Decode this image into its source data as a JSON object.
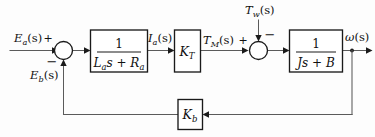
{
  "diagram": {
    "type": "control-system-block-diagram",
    "signals": {
      "input": "E",
      "input_sub": "a",
      "input_paren": "(s)",
      "feedback_voltage": "E",
      "feedback_voltage_sub": "b",
      "feedback_voltage_paren": "(s)",
      "armature_current": "I",
      "armature_current_sub": "a",
      "armature_current_paren": "(s)",
      "motor_torque": "T",
      "motor_torque_sub": "M",
      "motor_torque_paren": "(s)",
      "disturbance_torque": "T",
      "disturbance_torque_sub": "w",
      "disturbance_torque_paren": "(s)",
      "output": "ω",
      "output_paren": "(s)"
    },
    "blocks": [
      {
        "id": "electrical-block",
        "kind": "transfer-function",
        "numerator": "1",
        "denominator_main": "L",
        "denominator_sub": "a",
        "denominator_rest": "s + R",
        "denominator_sub2": "a",
        "label_plain": "1/(La s + Ra)"
      },
      {
        "id": "torque-constant-block",
        "kind": "gain",
        "symbol": "K",
        "subscript": "T",
        "label_plain": "KT"
      },
      {
        "id": "mechanical-block",
        "kind": "transfer-function",
        "numerator": "1",
        "denominator_main": "Js + B",
        "label_plain": "1/(Js + B)"
      },
      {
        "id": "back-emf-block",
        "kind": "gain",
        "symbol": "K",
        "subscript": "b",
        "label_plain": "Kb"
      }
    ],
    "summing_junctions": [
      {
        "id": "voltage-summer",
        "signs": {
          "left_input": "+",
          "bottom_input": "−"
        }
      },
      {
        "id": "torque-summer",
        "signs": {
          "left_input": "+",
          "top_input": "−"
        }
      }
    ]
  }
}
